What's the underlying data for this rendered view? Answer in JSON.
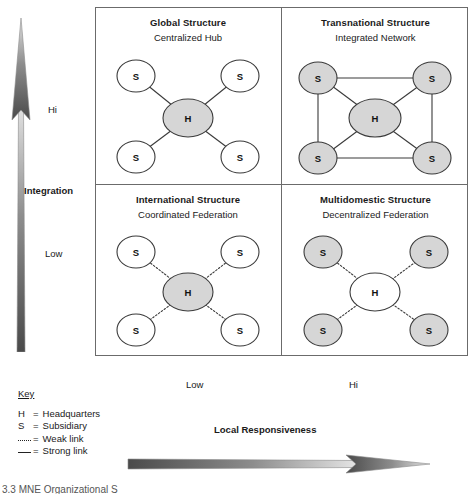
{
  "figure": {
    "caption_fragment": "3.3  MNE Organizational S"
  },
  "axes": {
    "vertical": {
      "label": "Integration",
      "high_label": "Hi",
      "low_label": "Low",
      "direction": "up"
    },
    "horizontal": {
      "label": "Local Responsiveness",
      "low_label": "Low",
      "high_label": "Hi",
      "direction": "right"
    }
  },
  "quadrants": [
    {
      "id": "global",
      "title": "Global Structure",
      "subtitle": "Centralized Hub",
      "position": "top-left",
      "integration": "Hi",
      "local_responsiveness": "Low",
      "hub": {
        "label": "H",
        "fill": "gray"
      },
      "subsidiaries": [
        {
          "label": "S",
          "fill": "white"
        },
        {
          "label": "S",
          "fill": "white"
        },
        {
          "label": "S",
          "fill": "white"
        },
        {
          "label": "S",
          "fill": "white"
        }
      ],
      "link_type": "strong",
      "subsidiary_interlinks": false
    },
    {
      "id": "transnational",
      "title": "Transnational Structure",
      "subtitle": "Integrated Network",
      "position": "top-right",
      "integration": "Hi",
      "local_responsiveness": "Hi",
      "hub": {
        "label": "H",
        "fill": "gray"
      },
      "subsidiaries": [
        {
          "label": "S",
          "fill": "gray"
        },
        {
          "label": "S",
          "fill": "gray"
        },
        {
          "label": "S",
          "fill": "gray"
        },
        {
          "label": "S",
          "fill": "gray"
        }
      ],
      "link_type": "strong",
      "subsidiary_interlinks": true
    },
    {
      "id": "international",
      "title": "International Structure",
      "subtitle": "Coordinated Federation",
      "position": "bottom-left",
      "integration": "Low",
      "local_responsiveness": "Low",
      "hub": {
        "label": "H",
        "fill": "gray"
      },
      "subsidiaries": [
        {
          "label": "S",
          "fill": "white"
        },
        {
          "label": "S",
          "fill": "white"
        },
        {
          "label": "S",
          "fill": "white"
        },
        {
          "label": "S",
          "fill": "white"
        }
      ],
      "link_type": "weak",
      "subsidiary_interlinks": false
    },
    {
      "id": "multidomestic",
      "title": "Multidomestic Structure",
      "subtitle": "Decentralized Federation",
      "position": "bottom-right",
      "integration": "Low",
      "local_responsiveness": "Hi",
      "hub": {
        "label": "H",
        "fill": "white"
      },
      "subsidiaries": [
        {
          "label": "S",
          "fill": "gray"
        },
        {
          "label": "S",
          "fill": "gray"
        },
        {
          "label": "S",
          "fill": "gray"
        },
        {
          "label": "S",
          "fill": "gray"
        }
      ],
      "link_type": "weak",
      "subsidiary_interlinks": false
    }
  ],
  "key": {
    "title": "Key",
    "entries": [
      {
        "glyph": "H",
        "separator": "=",
        "text": "Headquarters",
        "glyph_type": "text"
      },
      {
        "glyph": "S",
        "separator": "=",
        "text": "Subsidiary",
        "glyph_type": "text"
      },
      {
        "glyph": "····",
        "separator": "=",
        "text": "Weak link",
        "glyph_type": "dotted-line"
      },
      {
        "glyph": "—",
        "separator": "=",
        "text": "Strong link",
        "glyph_type": "solid-line"
      }
    ]
  },
  "colors": {
    "node_gray": "#d6d6d6",
    "node_white": "#ffffff",
    "stroke": "#3a3a3a",
    "box_border": "#6b6b6b",
    "arrow_dark": "#4a4a4a",
    "arrow_light": "#dcdcdc",
    "text": "#1a1a1a"
  }
}
